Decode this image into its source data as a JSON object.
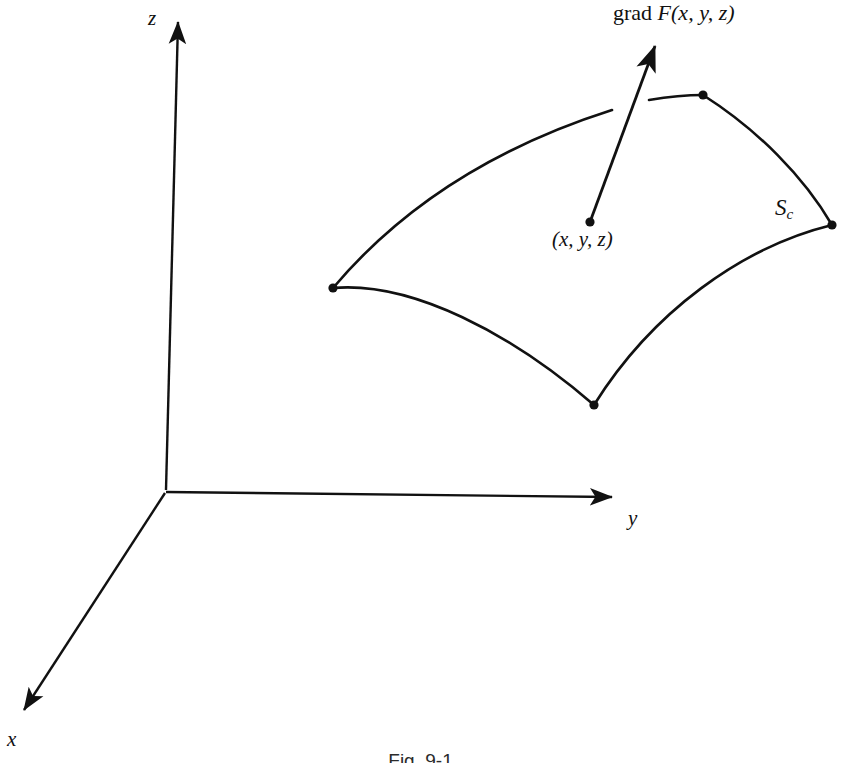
{
  "figure": {
    "caption": "Fig. 9-1",
    "background_color": "#ffffff",
    "stroke_color": "#111111"
  },
  "axes": {
    "origin": {
      "x": 165,
      "y": 492
    },
    "items": [
      {
        "name": "z-axis",
        "label": "z",
        "label_x": 148,
        "label_y": 8,
        "tip": {
          "x": 178,
          "y": 12
        },
        "base": {
          "x": 166,
          "y": 490
        }
      },
      {
        "name": "y-axis",
        "label": "y",
        "label_x": 628,
        "label_y": 508,
        "tip": {
          "x": 624,
          "y": 497
        },
        "base": {
          "x": 166,
          "y": 492
        }
      },
      {
        "name": "x-axis",
        "label": "x",
        "label_x": 7,
        "label_y": 729,
        "tip": {
          "x": 13,
          "y": 719
        },
        "base": {
          "x": 165,
          "y": 493
        }
      }
    ]
  },
  "surface": {
    "name": "level-surface",
    "label": "S",
    "label_subscript": "c",
    "label_x": 775,
    "label_y": 196,
    "corners": [
      {
        "name": "corner-left",
        "x": 333,
        "y": 288
      },
      {
        "name": "corner-top",
        "x": 703,
        "y": 95
      },
      {
        "name": "corner-right",
        "x": 832,
        "y": 225
      },
      {
        "name": "corner-bottom",
        "x": 594,
        "y": 405
      }
    ],
    "edges": [
      {
        "name": "edge-top-left",
        "from": "corner-left",
        "to": "corner-top",
        "path": "M 333 288 C 420 190, 540 122, 703 95"
      },
      {
        "name": "edge-top-right",
        "from": "corner-top",
        "to": "corner-right",
        "path": "M 703 95 C 760 128, 805 178, 832 225"
      },
      {
        "name": "edge-bottom-right",
        "from": "corner-right",
        "to": "corner-bottom",
        "path": "M 832 225 C 740 250, 650 315, 594 405"
      },
      {
        "name": "edge-bottom-left",
        "from": "corner-bottom",
        "to": "corner-left",
        "path": "M 594 405 C 500 330, 410 285, 333 288"
      }
    ],
    "occlusion_gap": {
      "x1": 612,
      "y1": 108,
      "x2": 648,
      "y2": 101
    }
  },
  "gradient_vector": {
    "name": "grad-vector",
    "label": "grad F(x, y, z)",
    "label_prefix": "grad ",
    "label_function": "F",
    "label_arguments": "(x, y, z)",
    "label_x": 613,
    "label_y": 2,
    "tail": {
      "x": 590,
      "y": 222
    },
    "head": {
      "x": 661,
      "y": 31
    }
  },
  "point": {
    "name": "surface-point",
    "label": "(x, y, z)",
    "label_x": 552,
    "label_y": 229,
    "x": 590,
    "y": 222
  }
}
